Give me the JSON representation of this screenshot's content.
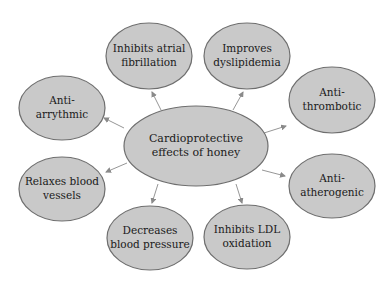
{
  "diagram": {
    "type": "radial concept map",
    "center": {
      "line1": "Cardioprotective",
      "line2": "effects of honey"
    },
    "effects": [
      {
        "id": "inhibits-atrial-fibrillation",
        "line1": "Inhibits atrial",
        "line2": "fibrillation"
      },
      {
        "id": "improves-dyslipidemia",
        "line1": "Improves",
        "line2": "dyslipidemia"
      },
      {
        "id": "anti-thrombotic",
        "line1": "Anti-",
        "line2": "thrombotic"
      },
      {
        "id": "anti-atherogenic",
        "line1": "Anti-",
        "line2": "atherogenic"
      },
      {
        "id": "inhibits-ldl-oxidation",
        "line1": "Inhibits LDL",
        "line2": "oxidation"
      },
      {
        "id": "decreases-blood-pressure",
        "line1": "Decreases",
        "line2": "blood pressure"
      },
      {
        "id": "relaxes-blood-vessels",
        "line1": "Relaxes blood",
        "line2": "vessels"
      },
      {
        "id": "anti-arrythmic",
        "line1": "Anti-",
        "line2": "arrythmic"
      }
    ],
    "colors": {
      "node_fill": "#c9c9c9",
      "node_stroke": "#6e6e6e",
      "arrow": "#8a8a8a"
    }
  }
}
